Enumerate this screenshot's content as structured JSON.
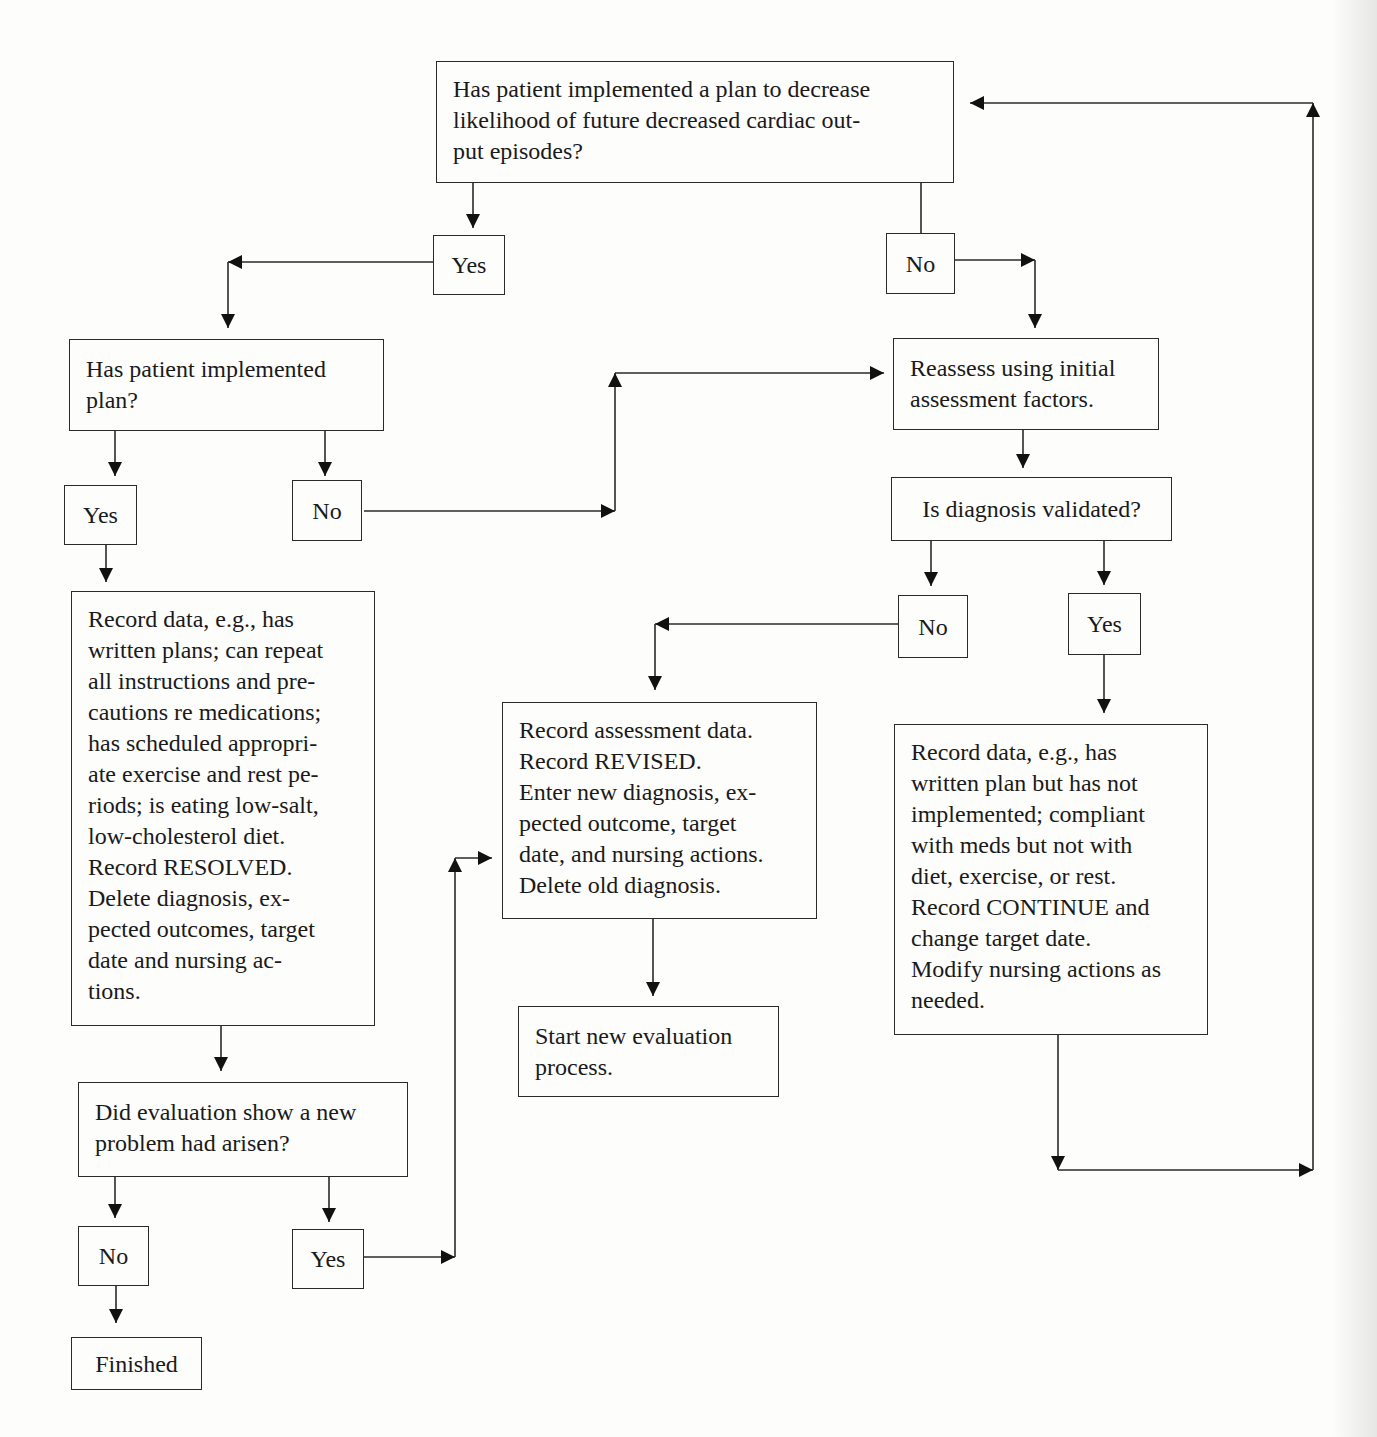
{
  "flowchart": {
    "nodes": {
      "q_plan": {
        "text": "Has patient implemented a plan to decrease\nlikelihood of future decreased cardiac out-\nput episodes?"
      },
      "q_plan_yes": {
        "text": "Yes"
      },
      "q_plan_no": {
        "text": "No"
      },
      "q_implemented": {
        "text": "Has patient implemented\nplan?"
      },
      "q_implemented_yes": {
        "text": "Yes"
      },
      "q_implemented_no": {
        "text": "No"
      },
      "record_resolved": {
        "text": "Record data, e.g., has\nwritten plans; can repeat\nall instructions and pre-\ncautions re medications;\nhas scheduled appropri-\nate exercise and rest pe-\nriods; is eating low-salt,\nlow-cholesterol diet.\nRecord RESOLVED.\nDelete diagnosis, ex-\npected outcomes, target\ndate and nursing ac-\ntions."
      },
      "q_new_problem": {
        "text": "Did evaluation show a new\nproblem had arisen?"
      },
      "q_new_problem_no": {
        "text": "No"
      },
      "q_new_problem_yes": {
        "text": "Yes"
      },
      "finished": {
        "text": "Finished"
      },
      "reassess": {
        "text": "Reassess using initial\nassessment factors."
      },
      "q_validated": {
        "text": "Is diagnosis validated?"
      },
      "q_validated_no": {
        "text": "No"
      },
      "q_validated_yes": {
        "text": "Yes"
      },
      "record_revised": {
        "text": "Record assessment data.\nRecord REVISED.\nEnter new diagnosis, ex-\npected outcome, target\ndate, and nursing actions.\nDelete old diagnosis."
      },
      "start_new": {
        "text": "Start new evaluation\nprocess."
      },
      "record_continue": {
        "text": "Record data, e.g., has\nwritten plan but has not\nimplemented; compliant\nwith meds but not with\ndiet, exercise, or rest.\nRecord CONTINUE and\nchange target date.\nModify nursing actions as\nneeded."
      }
    },
    "colors": {
      "line": "#2a2a2a",
      "arrowhead": "#111111",
      "background": "#fdfdfc"
    }
  }
}
